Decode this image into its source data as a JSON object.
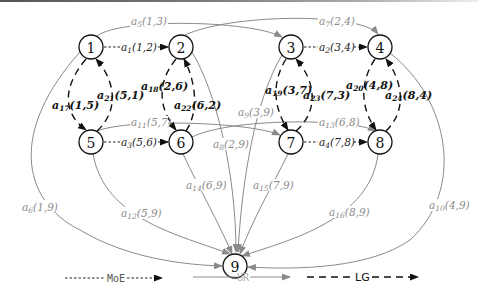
{
  "nodes": [
    {
      "id": "1",
      "label": "1"
    },
    {
      "id": "2",
      "label": "2"
    },
    {
      "id": "3",
      "label": "3"
    },
    {
      "id": "4",
      "label": "4"
    },
    {
      "id": "5",
      "label": "5"
    },
    {
      "id": "6",
      "label": "6"
    },
    {
      "id": "7",
      "label": "7"
    },
    {
      "id": "8",
      "label": "8"
    },
    {
      "id": "9",
      "label": "9"
    }
  ],
  "edges": {
    "moe": [
      {
        "name": "a",
        "sub": "1",
        "pair": "(1,2)"
      },
      {
        "name": "a",
        "sub": "2",
        "pair": "(3,4)"
      },
      {
        "name": "a",
        "sub": "3",
        "pair": "(5,6)"
      },
      {
        "name": "a",
        "sub": "4",
        "pair": "(7,8)"
      }
    ],
    "ur": [
      {
        "name": "a",
        "sub": "5",
        "pair": "(1,3)"
      },
      {
        "name": "a",
        "sub": "6",
        "pair": "(1,9)"
      },
      {
        "name": "a",
        "sub": "7",
        "pair": "(2,4)"
      },
      {
        "name": "a",
        "sub": "8",
        "pair": "(2,9)"
      },
      {
        "name": "a",
        "sub": "9",
        "pair": "(3,9)"
      },
      {
        "name": "a",
        "sub": "10",
        "pair": "(4,9)"
      },
      {
        "name": "a",
        "sub": "11",
        "pair": "(5,7)"
      },
      {
        "name": "a",
        "sub": "12",
        "pair": "(5,9)"
      },
      {
        "name": "a",
        "sub": "13",
        "pair": "(6,8)"
      },
      {
        "name": "a",
        "sub": "14",
        "pair": "(6,9)"
      },
      {
        "name": "a",
        "sub": "15",
        "pair": "(7,9)"
      },
      {
        "name": "a",
        "sub": "16",
        "pair": "(8,9)"
      }
    ],
    "lg": [
      {
        "name": "a",
        "sub": "17",
        "pair": "(1,5)"
      },
      {
        "name": "a",
        "sub": "18",
        "pair": "(2,6)"
      },
      {
        "name": "a",
        "sub": "19",
        "pair": "(3,7)"
      },
      {
        "name": "a",
        "sub": "20",
        "pair": "(4,8)"
      },
      {
        "name": "a",
        "sub": "21",
        "pair": "(5,1)"
      },
      {
        "name": "a",
        "sub": "22",
        "pair": "(6,2)"
      },
      {
        "name": "a",
        "sub": "23",
        "pair": "(7,3)"
      },
      {
        "name": "a",
        "sub": "24",
        "pair": "(8,4)"
      }
    ]
  },
  "legend": {
    "moe": "MoE",
    "ur": "UR",
    "lg": "LG"
  },
  "colors": {
    "moe": "#222222",
    "ur": "#8a8a8a",
    "lg": "#111111"
  }
}
